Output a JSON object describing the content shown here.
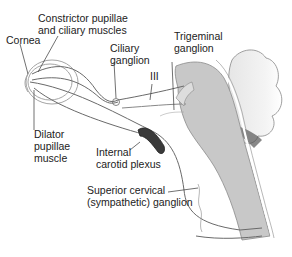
{
  "diagram": {
    "labels": {
      "cornea": "Cornea",
      "constrictor_line1": "Constrictor pupillae",
      "constrictor_line2": "and ciliary muscles",
      "ciliary_line1": "Ciliary",
      "ciliary_line2": "ganglion",
      "cn3": "III",
      "trigeminal_line1": "Trigeminal",
      "trigeminal_line2": "ganglion",
      "dilator_line1": "Dilator",
      "dilator_line2": "pupillae",
      "dilator_line3": "muscle",
      "carotid_line1": "Internal",
      "carotid_line2": "carotid plexus",
      "cervical_line1": "Superior cervical",
      "cervical_line2": "(sympathetic) ganglion"
    },
    "colors": {
      "brainstem": "#c8c8c8",
      "nerve": "#6a6a6a",
      "plexus": "#3a3a3a",
      "outline": "#9a9a9a"
    }
  }
}
